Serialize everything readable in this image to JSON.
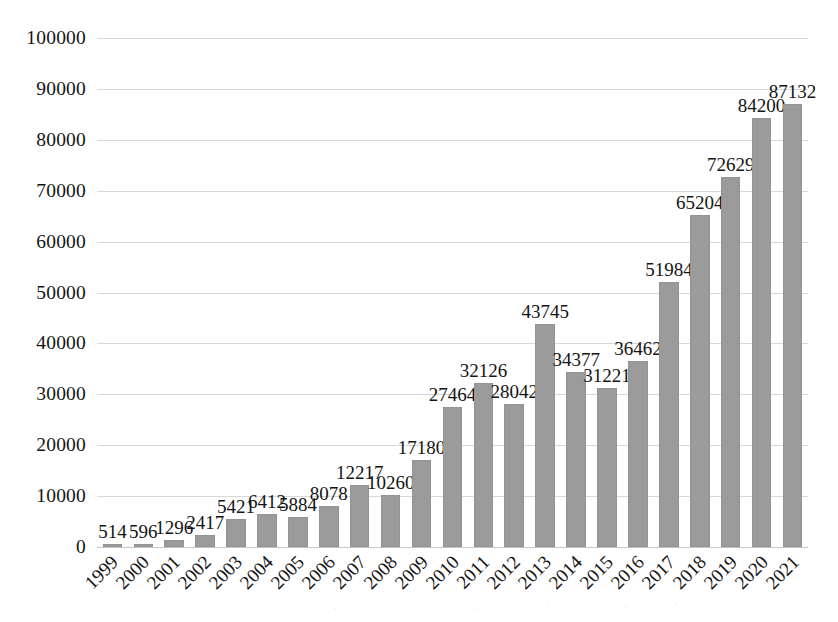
{
  "chart_data": {
    "type": "bar",
    "title": "",
    "subtitle": "",
    "xlabel": "",
    "ylabel": "",
    "categories": [
      "1999",
      "2000",
      "2001",
      "2002",
      "2003",
      "2004",
      "2005",
      "2006",
      "2007",
      "2008",
      "2009",
      "2010",
      "2011",
      "2012",
      "2013",
      "2014",
      "2015",
      "2016",
      "2017",
      "2018",
      "2019",
      "2020",
      "2021"
    ],
    "values": [
      514,
      596,
      1296,
      2417,
      5421,
      6412,
      5884,
      8078,
      12217,
      10260,
      17180,
      27464,
      32126,
      28042,
      43745,
      34377,
      31221,
      36462,
      51984,
      65204,
      72629,
      84200,
      87132
    ],
    "data_labels": [
      "514",
      "596",
      "1296",
      "2417",
      "5421",
      "6412",
      "5884",
      "8078",
      "12217",
      "10260",
      "17180",
      "27464",
      "32126",
      "28042",
      "43745",
      "34377",
      "31221",
      "36462",
      "51984",
      "65204",
      "72629",
      "84200",
      "87132"
    ],
    "ylim": [
      0,
      100000
    ],
    "ytick_step": 10000,
    "ytick_labels": [
      "0",
      "10000",
      "20000",
      "30000",
      "40000",
      "50000",
      "60000",
      "70000",
      "80000",
      "90000",
      "100000"
    ],
    "xtick_rotation_deg": -45,
    "grid": true,
    "grid_axis": "y",
    "legend": false,
    "legend_position": "none",
    "bar_color": "#9b9b9b",
    "gridline_color": "#d5d8dc",
    "text_color": "#141414",
    "background_color": "#ffffff",
    "show_data_labels": true
  }
}
